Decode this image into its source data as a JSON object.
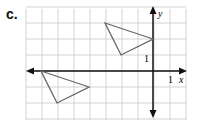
{
  "label": "c.",
  "axes": {
    "x_label": "x",
    "y_label": "y",
    "x_tick": "1",
    "y_tick": "1"
  },
  "grid": {
    "xmin": -8,
    "xmax": 2,
    "ymin": -3,
    "ymax": 4
  },
  "triangles": [
    {
      "name": "upper",
      "vertices": [
        [
          -3,
          3
        ],
        [
          0,
          2
        ],
        [
          -2,
          1
        ]
      ]
    },
    {
      "name": "lower",
      "vertices": [
        [
          -7,
          0
        ],
        [
          -4,
          -1
        ],
        [
          -6,
          -2
        ]
      ]
    }
  ],
  "colors": {
    "grid": "#c8c8c8",
    "axis": "#111111",
    "triangle": "#666666"
  }
}
